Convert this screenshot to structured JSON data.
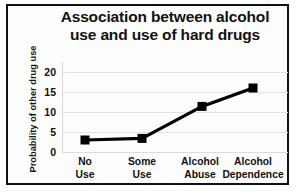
{
  "chart_data": {
    "type": "line",
    "title": "Association between alcohol use and use of hard drugs",
    "title_lines": [
      "Association between alcohol",
      "use and use of hard drugs"
    ],
    "categories": [
      "No Use",
      "Some Use",
      "Alcohol Abuse",
      "Alcohol Dependence"
    ],
    "category_lines": [
      [
        "No",
        "Use"
      ],
      [
        "Some",
        "Use"
      ],
      [
        "Alcohol",
        "Abuse"
      ],
      [
        "Alcohol",
        "Dependence"
      ]
    ],
    "values": [
      3,
      3.4,
      11.4,
      16
    ],
    "xlabel": "",
    "ylabel": "Probability of other drug use",
    "ylim": [
      0,
      22.5
    ],
    "yticks": [
      0,
      5,
      10,
      15,
      20
    ],
    "ytick_labels": [
      "0",
      "5",
      "10",
      "15",
      "20"
    ],
    "grid": true,
    "legend": false,
    "marker": "square",
    "series_color": "#000000",
    "grid_color": "#e3e3e3",
    "border_color": "#121212",
    "background_color": "#ffffff"
  }
}
